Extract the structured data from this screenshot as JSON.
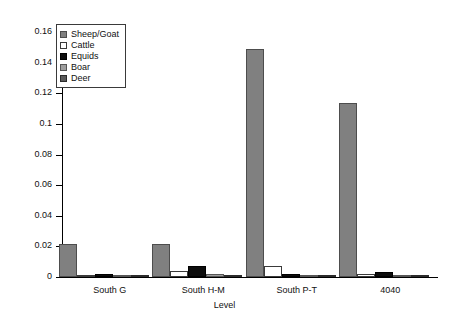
{
  "chart_data": {
    "type": "bar",
    "title": "",
    "xlabel": "Level",
    "ylabel": "",
    "ylim": [
      0,
      0.16
    ],
    "yticks": [
      "0",
      "0.02",
      "0.04",
      "0.06",
      "0.08",
      "0.1",
      "0.12",
      "0.14",
      "0.16"
    ],
    "ytick_values": [
      0,
      0.02,
      0.04,
      0.06,
      0.08,
      0.1,
      0.12,
      0.14,
      0.16
    ],
    "grid": false,
    "legend_position": "top-left",
    "categories": [
      "South G",
      "South H-M",
      "South P-T",
      "4040"
    ],
    "series": [
      {
        "name": "Sheep/Goat",
        "color": "#808080",
        "values": [
          0.0215,
          0.0215,
          0.149,
          0.1135
        ]
      },
      {
        "name": "Cattle",
        "color": "#ffffff",
        "values": [
          0.0012,
          0.0042,
          0.0075,
          0.0022
        ]
      },
      {
        "name": "Equids",
        "color": "#0d0d0d",
        "values": [
          0.0018,
          0.0072,
          0.0022,
          0.003
        ]
      },
      {
        "name": "Boar",
        "color": "#9e9e9e",
        "values": [
          0.0016,
          0.002,
          0.0016,
          0.0006
        ]
      },
      {
        "name": "Deer",
        "color": "#5a5a5a",
        "values": [
          0.0006,
          0.0005,
          0.0009,
          0.0012
        ]
      }
    ]
  },
  "legend": {
    "items": [
      {
        "label": "Sheep/Goat"
      },
      {
        "label": "Cattle"
      },
      {
        "label": "Equids"
      },
      {
        "label": "Boar"
      },
      {
        "label": "Deer"
      }
    ]
  }
}
